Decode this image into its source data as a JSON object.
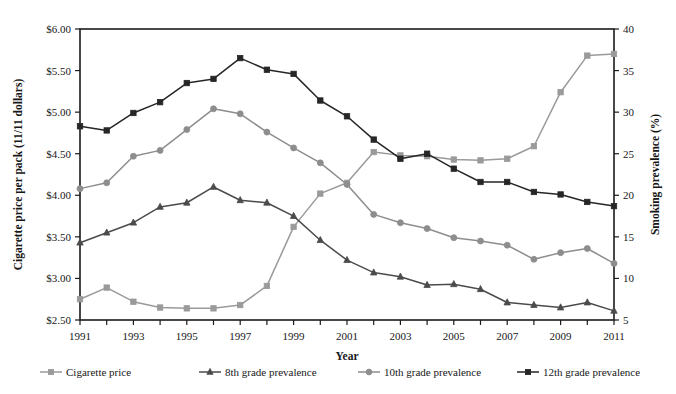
{
  "chart_data": {
    "type": "line",
    "title": "",
    "xlabel": "Year",
    "ylabel": "Cigarette price per pack (11/11 dollars)",
    "y2label": "Smoking prevalence (%)",
    "grid": false,
    "legend_position": "bottom",
    "x": [
      1991,
      1992,
      1993,
      1994,
      1995,
      1996,
      1997,
      1998,
      1999,
      2000,
      2001,
      2002,
      2003,
      2004,
      2005,
      2006,
      2007,
      2008,
      2009,
      2010,
      2011
    ],
    "xlim": [
      1991,
      2011
    ],
    "xtick_labels": [
      "1991",
      "1993",
      "1995",
      "1997",
      "1999",
      "2001",
      "2003",
      "2005",
      "2007",
      "2009",
      "2011"
    ],
    "xticks": [
      1991,
      1993,
      1995,
      1997,
      1999,
      2001,
      2003,
      2005,
      2007,
      2009,
      2011
    ],
    "ylim": [
      2.5,
      6.0
    ],
    "ytick_labels": [
      "$2.50",
      "$3.00",
      "$3.50",
      "$4.00",
      "$4.50",
      "$5.00",
      "$5.50",
      "$6.00"
    ],
    "yticks": [
      2.5,
      3.0,
      3.5,
      4.0,
      4.5,
      5.0,
      5.5,
      6.0
    ],
    "y2lim": [
      5,
      40
    ],
    "y2tick_labels": [
      "5",
      "10",
      "15",
      "20",
      "25",
      "30",
      "35",
      "40"
    ],
    "y2ticks": [
      5,
      10,
      15,
      20,
      25,
      30,
      35,
      40
    ],
    "series": [
      {
        "name": "Cigarette price",
        "axis": "left",
        "marker": "square",
        "color": "#9a9a9a",
        "values": [
          2.75,
          2.89,
          2.72,
          2.65,
          2.64,
          2.64,
          2.68,
          2.91,
          3.62,
          4.02,
          4.15,
          4.52,
          4.48,
          4.47,
          4.43,
          4.42,
          4.44,
          4.59,
          5.24,
          5.68,
          5.7
        ]
      },
      {
        "name": "8th grade prevalence",
        "axis": "right",
        "marker": "triangle",
        "color": "#4b4b4b",
        "values": [
          14.3,
          15.5,
          16.7,
          18.6,
          19.1,
          21.0,
          19.4,
          19.1,
          17.5,
          14.6,
          12.2,
          10.7,
          10.2,
          9.2,
          9.3,
          8.7,
          7.1,
          6.8,
          6.5,
          7.1,
          6.1
        ]
      },
      {
        "name": "10th grade prevalence",
        "axis": "right",
        "marker": "circle",
        "color": "#8d8d8d",
        "values": [
          20.8,
          21.5,
          24.7,
          25.4,
          27.9,
          30.4,
          29.8,
          27.6,
          25.7,
          23.9,
          21.3,
          17.7,
          16.7,
          16.0,
          14.9,
          14.5,
          14.0,
          12.3,
          13.1,
          13.6,
          11.8
        ]
      },
      {
        "name": "12th grade prevalence",
        "axis": "right",
        "marker": "square",
        "color": "#262626",
        "values": [
          28.3,
          27.8,
          29.9,
          31.2,
          33.5,
          34.0,
          36.5,
          35.1,
          34.6,
          31.4,
          29.5,
          26.7,
          24.4,
          25.0,
          23.2,
          21.6,
          21.6,
          20.4,
          20.1,
          19.2,
          18.7
        ]
      }
    ]
  },
  "legend": {
    "items": [
      {
        "label": "Cigarette price"
      },
      {
        "label": "8th grade prevalence"
      },
      {
        "label": "10th grade prevalence"
      },
      {
        "label": "12th grade prevalence"
      }
    ]
  }
}
